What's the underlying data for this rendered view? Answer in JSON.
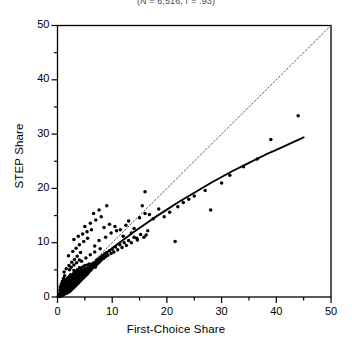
{
  "chart_data": {
    "type": "scatter",
    "title": "(N = 6,516, r = .93)",
    "xlabel": "First-Choice Share",
    "ylabel": "STEP Share",
    "xlim": [
      0,
      50
    ],
    "ylim": [
      0,
      50
    ],
    "xticks": [
      0,
      10,
      20,
      30,
      40,
      50
    ],
    "yticks": [
      0,
      10,
      20,
      30,
      40,
      50
    ],
    "xtick_labels": [
      "0",
      "10",
      "20",
      "30",
      "40",
      "50"
    ],
    "ytick_labels": [
      "0",
      "10",
      "20",
      "30",
      "40",
      "50"
    ],
    "minor_tick_interval": 5,
    "grid": false,
    "legend": null,
    "marker": "filled-circle",
    "marker_color": "#000000",
    "marker_size_px": 2.4,
    "reference_line": {
      "name": "identity-line",
      "style": "dotted",
      "color": "#555555",
      "from": [
        0,
        0
      ],
      "to": [
        50,
        50
      ]
    },
    "fit_curve": {
      "name": "fitted-curve",
      "style": "solid",
      "color": "#000000",
      "description": "concave increasing fit lying below the identity line at high values",
      "points": [
        [
          0,
          0
        ],
        [
          1,
          1.0
        ],
        [
          2,
          2.0
        ],
        [
          3,
          3.0
        ],
        [
          4,
          3.9
        ],
        [
          5,
          4.8
        ],
        [
          6,
          5.7
        ],
        [
          7,
          6.6
        ],
        [
          8,
          7.4
        ],
        [
          9,
          8.2
        ],
        [
          10,
          9.0
        ],
        [
          12,
          10.5
        ],
        [
          14,
          12.0
        ],
        [
          16,
          13.4
        ],
        [
          18,
          14.8
        ],
        [
          20,
          16.1
        ],
        [
          22,
          17.4
        ],
        [
          24,
          18.6
        ],
        [
          26,
          19.8
        ],
        [
          28,
          21.0
        ],
        [
          30,
          22.1
        ],
        [
          32,
          23.2
        ],
        [
          34,
          24.2
        ],
        [
          36,
          25.2
        ],
        [
          38,
          26.2
        ],
        [
          40,
          27.1
        ],
        [
          42,
          28.0
        ],
        [
          45,
          29.4
        ]
      ]
    },
    "points": [
      [
        0.2,
        0.2
      ],
      [
        0.3,
        0.1
      ],
      [
        0.3,
        0.4
      ],
      [
        0.4,
        0.2
      ],
      [
        0.4,
        0.6
      ],
      [
        0.5,
        0.3
      ],
      [
        0.5,
        0.8
      ],
      [
        0.6,
        0.2
      ],
      [
        0.6,
        0.5
      ],
      [
        0.6,
        1.0
      ],
      [
        0.7,
        0.3
      ],
      [
        0.7,
        0.7
      ],
      [
        0.7,
        1.2
      ],
      [
        0.8,
        0.4
      ],
      [
        0.8,
        0.9
      ],
      [
        0.8,
        1.4
      ],
      [
        0.9,
        0.5
      ],
      [
        0.9,
        1.0
      ],
      [
        0.9,
        1.6
      ],
      [
        1.0,
        0.3
      ],
      [
        1.0,
        0.7
      ],
      [
        1.0,
        1.2
      ],
      [
        1.0,
        1.8
      ],
      [
        1.1,
        0.5
      ],
      [
        1.1,
        1.0
      ],
      [
        1.1,
        1.5
      ],
      [
        1.1,
        2.1
      ],
      [
        1.2,
        0.6
      ],
      [
        1.2,
        1.2
      ],
      [
        1.2,
        1.8
      ],
      [
        1.2,
        2.4
      ],
      [
        1.3,
        0.8
      ],
      [
        1.3,
        1.4
      ],
      [
        1.3,
        2.0
      ],
      [
        1.3,
        2.7
      ],
      [
        1.4,
        0.6
      ],
      [
        1.4,
        1.1
      ],
      [
        1.4,
        1.7
      ],
      [
        1.4,
        2.3
      ],
      [
        1.5,
        0.9
      ],
      [
        1.5,
        1.5
      ],
      [
        1.5,
        2.1
      ],
      [
        1.5,
        2.8
      ],
      [
        1.6,
        0.7
      ],
      [
        1.6,
        1.3
      ],
      [
        1.6,
        1.9
      ],
      [
        1.6,
        2.6
      ],
      [
        1.6,
        3.2
      ],
      [
        1.7,
        1.0
      ],
      [
        1.7,
        1.6
      ],
      [
        1.7,
        2.3
      ],
      [
        1.7,
        3.0
      ],
      [
        1.8,
        0.8
      ],
      [
        1.8,
        1.4
      ],
      [
        1.8,
        2.0
      ],
      [
        1.8,
        2.7
      ],
      [
        1.8,
        3.4
      ],
      [
        1.9,
        1.1
      ],
      [
        1.9,
        1.8
      ],
      [
        1.9,
        2.5
      ],
      [
        1.9,
        3.2
      ],
      [
        2.0,
        0.9
      ],
      [
        2.0,
        1.5
      ],
      [
        2.0,
        2.2
      ],
      [
        2.0,
        2.9
      ],
      [
        2.0,
        3.6
      ],
      [
        2.1,
        1.2
      ],
      [
        2.1,
        1.9
      ],
      [
        2.1,
        2.6
      ],
      [
        2.1,
        3.3
      ],
      [
        2.2,
        1.0
      ],
      [
        2.2,
        1.7
      ],
      [
        2.2,
        2.4
      ],
      [
        2.2,
        3.1
      ],
      [
        2.2,
        3.8
      ],
      [
        2.3,
        1.4
      ],
      [
        2.3,
        2.1
      ],
      [
        2.3,
        2.8
      ],
      [
        2.3,
        3.5
      ],
      [
        2.4,
        1.2
      ],
      [
        2.4,
        1.9
      ],
      [
        2.4,
        2.6
      ],
      [
        2.4,
        3.3
      ],
      [
        2.4,
        4.1
      ],
      [
        2.5,
        1.6
      ],
      [
        2.5,
        2.3
      ],
      [
        2.5,
        3.0
      ],
      [
        2.5,
        3.8
      ],
      [
        2.6,
        1.4
      ],
      [
        2.6,
        2.1
      ],
      [
        2.6,
        2.8
      ],
      [
        2.6,
        3.6
      ],
      [
        2.7,
        1.8
      ],
      [
        2.7,
        2.5
      ],
      [
        2.7,
        3.3
      ],
      [
        2.7,
        4.0
      ],
      [
        2.8,
        1.6
      ],
      [
        2.8,
        2.3
      ],
      [
        2.8,
        3.1
      ],
      [
        2.8,
        3.9
      ],
      [
        2.9,
        2.0
      ],
      [
        2.9,
        2.7
      ],
      [
        2.9,
        3.5
      ],
      [
        2.9,
        4.3
      ],
      [
        3.0,
        1.8
      ],
      [
        3.0,
        2.5
      ],
      [
        3.0,
        3.3
      ],
      [
        3.0,
        4.1
      ],
      [
        3.0,
        4.9
      ],
      [
        3.1,
        2.2
      ],
      [
        3.1,
        3.0
      ],
      [
        3.1,
        3.8
      ],
      [
        3.2,
        2.0
      ],
      [
        3.2,
        2.8
      ],
      [
        3.2,
        3.6
      ],
      [
        3.2,
        4.4
      ],
      [
        3.3,
        2.4
      ],
      [
        3.3,
        3.2
      ],
      [
        3.3,
        4.0
      ],
      [
        3.4,
        2.2
      ],
      [
        3.4,
        3.0
      ],
      [
        3.4,
        3.8
      ],
      [
        3.4,
        4.7
      ],
      [
        3.5,
        2.6
      ],
      [
        3.5,
        3.4
      ],
      [
        3.5,
        4.2
      ],
      [
        3.6,
        2.4
      ],
      [
        3.6,
        3.2
      ],
      [
        3.6,
        4.1
      ],
      [
        3.6,
        5.0
      ],
      [
        3.7,
        2.8
      ],
      [
        3.7,
        3.7
      ],
      [
        3.7,
        4.5
      ],
      [
        3.8,
        2.6
      ],
      [
        3.8,
        3.4
      ],
      [
        3.8,
        4.3
      ],
      [
        3.9,
        3.0
      ],
      [
        3.9,
        3.9
      ],
      [
        3.9,
        4.8
      ],
      [
        4.0,
        2.8
      ],
      [
        4.0,
        3.6
      ],
      [
        4.0,
        4.5
      ],
      [
        4.0,
        5.4
      ],
      [
        4.1,
        3.2
      ],
      [
        4.1,
        4.1
      ],
      [
        4.2,
        3.0
      ],
      [
        4.2,
        3.9
      ],
      [
        4.2,
        4.8
      ],
      [
        4.3,
        3.4
      ],
      [
        4.3,
        4.3
      ],
      [
        4.3,
        5.2
      ],
      [
        4.4,
        3.2
      ],
      [
        4.4,
        4.1
      ],
      [
        4.5,
        3.6
      ],
      [
        4.5,
        4.5
      ],
      [
        4.5,
        5.5
      ],
      [
        4.6,
        3.4
      ],
      [
        4.6,
        4.3
      ],
      [
        4.7,
        3.8
      ],
      [
        4.7,
        4.8
      ],
      [
        4.8,
        3.6
      ],
      [
        4.8,
        4.6
      ],
      [
        4.8,
        5.6
      ],
      [
        4.9,
        4.0
      ],
      [
        4.9,
        5.0
      ],
      [
        5.0,
        3.8
      ],
      [
        5.0,
        4.8
      ],
      [
        5.0,
        5.8
      ],
      [
        5.1,
        4.2
      ],
      [
        5.2,
        4.0
      ],
      [
        5.2,
        5.1
      ],
      [
        5.3,
        4.5
      ],
      [
        5.4,
        4.2
      ],
      [
        5.4,
        5.3
      ],
      [
        5.5,
        4.7
      ],
      [
        5.5,
        5.9
      ],
      [
        5.6,
        4.4
      ],
      [
        5.7,
        5.0
      ],
      [
        5.8,
        4.7
      ],
      [
        5.8,
        6.1
      ],
      [
        5.9,
        5.3
      ],
      [
        6.0,
        4.9
      ],
      [
        6.0,
        6.0
      ],
      [
        6.1,
        5.5
      ],
      [
        6.2,
        5.1
      ],
      [
        6.3,
        5.8
      ],
      [
        6.4,
        5.4
      ],
      [
        6.5,
        6.2
      ],
      [
        6.6,
        5.7
      ],
      [
        6.8,
        6.0
      ],
      [
        6.9,
        5.5
      ],
      [
        7.0,
        6.4
      ],
      [
        7.1,
        5.9
      ],
      [
        7.2,
        6.8
      ],
      [
        7.4,
        6.2
      ],
      [
        7.5,
        7.0
      ],
      [
        7.7,
        6.5
      ],
      [
        7.9,
        7.3
      ],
      [
        8.0,
        6.8
      ],
      [
        8.2,
        7.6
      ],
      [
        8.4,
        7.1
      ],
      [
        8.6,
        7.9
      ],
      [
        8.8,
        7.4
      ],
      [
        9.0,
        8.2
      ],
      [
        9.2,
        7.7
      ],
      [
        9.5,
        8.5
      ],
      [
        9.8,
        8.0
      ],
      [
        10.0,
        8.8
      ],
      [
        10.3,
        8.3
      ],
      [
        10.6,
        9.2
      ],
      [
        11.0,
        8.7
      ],
      [
        11.4,
        9.6
      ],
      [
        11.8,
        9.1
      ],
      [
        12.2,
        10.0
      ],
      [
        12.6,
        9.5
      ],
      [
        13.0,
        10.4
      ],
      [
        13.5,
        10.0
      ],
      [
        14.0,
        11.0
      ],
      [
        14.6,
        10.5
      ],
      [
        15.2,
        11.5
      ],
      [
        15.8,
        11.0
      ],
      [
        16.5,
        12.2
      ],
      [
        1.2,
        4.6
      ],
      [
        1.6,
        5.2
      ],
      [
        2.1,
        5.8
      ],
      [
        2.6,
        6.4
      ],
      [
        3.1,
        6.9
      ],
      [
        3.6,
        7.5
      ],
      [
        4.2,
        8.2
      ],
      [
        2.0,
        7.6
      ],
      [
        2.8,
        8.4
      ],
      [
        3.4,
        9.0
      ],
      [
        4.0,
        9.6
      ],
      [
        4.8,
        10.2
      ],
      [
        5.5,
        10.8
      ],
      [
        3.0,
        10.6
      ],
      [
        3.8,
        11.2
      ],
      [
        4.6,
        11.6
      ],
      [
        5.4,
        12.0
      ],
      [
        6.2,
        12.4
      ],
      [
        5.0,
        13.0
      ],
      [
        6.0,
        13.6
      ],
      [
        7.0,
        14.2
      ],
      [
        8.0,
        14.8
      ],
      [
        6.6,
        15.4
      ],
      [
        7.6,
        16.0
      ],
      [
        9.0,
        16.8
      ],
      [
        8.5,
        12.8
      ],
      [
        9.5,
        13.4
      ],
      [
        10.5,
        13.0
      ],
      [
        11.5,
        12.4
      ],
      [
        12.5,
        13.2
      ],
      [
        13.0,
        14.0
      ],
      [
        14.0,
        12.6
      ],
      [
        15.0,
        14.6
      ],
      [
        16.0,
        15.4
      ],
      [
        12.0,
        11.2
      ],
      [
        13.5,
        11.8
      ],
      [
        14.5,
        10.8
      ],
      [
        16.2,
        11.4
      ],
      [
        15.5,
        16.8
      ],
      [
        16.0,
        19.4
      ],
      [
        16.8,
        15.2
      ],
      [
        17.5,
        14.4
      ],
      [
        18.5,
        16.2
      ],
      [
        19.5,
        14.8
      ],
      [
        20.5,
        15.6
      ],
      [
        21.5,
        10.2
      ],
      [
        22.0,
        16.6
      ],
      [
        23.0,
        17.4
      ],
      [
        24.0,
        18.0
      ],
      [
        25.0,
        18.6
      ],
      [
        27.0,
        19.6
      ],
      [
        28.0,
        16.0
      ],
      [
        30.0,
        21.0
      ],
      [
        31.5,
        22.4
      ],
      [
        34.0,
        24.0
      ],
      [
        36.5,
        25.4
      ],
      [
        39.0,
        29.0
      ],
      [
        44.0,
        33.4
      ],
      [
        6.8,
        9.4
      ],
      [
        7.6,
        10.4
      ],
      [
        8.8,
        11.0
      ],
      [
        9.8,
        11.8
      ],
      [
        10.8,
        12.2
      ],
      [
        4.4,
        6.6
      ],
      [
        5.2,
        7.2
      ],
      [
        6.0,
        7.8
      ],
      [
        6.8,
        8.3
      ],
      [
        7.8,
        8.9
      ],
      [
        0.5,
        1.9
      ],
      [
        0.7,
        2.4
      ],
      [
        0.9,
        2.9
      ],
      [
        1.1,
        3.4
      ],
      [
        1.3,
        3.9
      ],
      [
        0.4,
        1.3
      ],
      [
        0.6,
        1.7
      ],
      [
        0.8,
        2.2
      ],
      [
        1.0,
        2.6
      ],
      [
        1.2,
        3.0
      ],
      [
        2.2,
        5.0
      ],
      [
        2.5,
        5.5
      ],
      [
        3.0,
        5.9
      ],
      [
        3.5,
        6.3
      ],
      [
        4.0,
        6.8
      ]
    ]
  }
}
